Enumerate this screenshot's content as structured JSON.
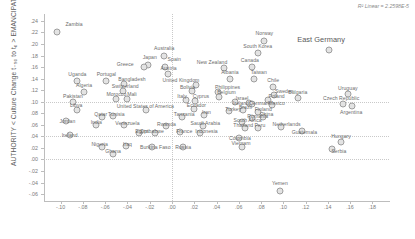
{
  "chart_data": {
    "type": "scatter",
    "title": "",
    "xlabel": "",
    "ylabel": "AUTHORITY < Culture Change t₋₉₀ to t₀ > EMANCIPATION",
    "annotation": "R² Linear = 2.2598E-5",
    "xlim": [
      -0.115,
      0.195
    ],
    "ylim": [
      -0.072,
      0.252
    ],
    "xticks": [
      "-.10",
      "-.08",
      "-.06",
      "-.04",
      "-.02",
      ".00",
      ".02",
      ".04",
      ".06",
      ".08",
      ".10",
      ".12",
      ".14",
      ".16",
      ".18"
    ],
    "xtick_values": [
      -0.1,
      -0.08,
      -0.06,
      -0.04,
      -0.02,
      0.0,
      0.02,
      0.04,
      0.06,
      0.08,
      0.1,
      0.12,
      0.14,
      0.16,
      0.18
    ],
    "yticks": [
      ".24",
      ".22",
      ".20",
      ".18",
      ".16",
      ".14",
      ".12",
      ".10",
      ".08",
      ".06",
      ".04",
      ".02",
      ".00",
      "-.02",
      "-.04",
      "-.06"
    ],
    "ytick_values": [
      0.24,
      0.22,
      0.2,
      0.18,
      0.16,
      0.14,
      0.12,
      0.1,
      0.08,
      0.06,
      0.04,
      0.02,
      0.0,
      -0.02,
      -0.04,
      -0.06
    ],
    "grid": true,
    "gridlines_y": [
      0.1,
      0.04,
      0.0
    ],
    "gridlines_x": [
      0.0
    ],
    "legend": "none",
    "marker_color": "#e3e3e3",
    "marker_edge_color": "#9e9e9e",
    "points": [
      {
        "label": "Zambia",
        "x": -0.103,
        "y": 0.221,
        "lx": -0.088,
        "ly": 0.235
      },
      {
        "label": "East Germany",
        "x": 0.141,
        "y": 0.19,
        "lx": 0.134,
        "ly": 0.208,
        "size": "big"
      },
      {
        "label": "Norway",
        "x": 0.083,
        "y": 0.206,
        "lx": 0.083,
        "ly": 0.219
      },
      {
        "label": "South Korea",
        "x": 0.077,
        "y": 0.184,
        "lx": 0.077,
        "ly": 0.197
      },
      {
        "label": "Australia",
        "x": -0.007,
        "y": 0.18,
        "lx": -0.007,
        "ly": 0.193
      },
      {
        "label": "Japan",
        "x": -0.022,
        "y": 0.163,
        "lx": -0.02,
        "ly": 0.177
      },
      {
        "label": "Spain",
        "x": -0.006,
        "y": 0.161,
        "lx": 0.002,
        "ly": 0.174
      },
      {
        "label": "Greece",
        "x": -0.025,
        "y": 0.16,
        "lx": -0.042,
        "ly": 0.166
      },
      {
        "label": "New Zealand",
        "x": 0.047,
        "y": 0.158,
        "lx": 0.036,
        "ly": 0.168
      },
      {
        "label": "Canada",
        "x": 0.072,
        "y": 0.16,
        "lx": 0.07,
        "ly": 0.172
      },
      {
        "label": "Austria",
        "x": -0.004,
        "y": 0.148,
        "lx": -0.003,
        "ly": 0.159
      },
      {
        "label": "Albania",
        "x": 0.052,
        "y": 0.14,
        "lx": 0.052,
        "ly": 0.152
      },
      {
        "label": "Taiwan",
        "x": 0.074,
        "y": 0.139,
        "lx": 0.078,
        "ly": 0.151
      },
      {
        "label": "Uganda",
        "x": -0.085,
        "y": 0.136,
        "lx": -0.085,
        "ly": 0.148
      },
      {
        "label": "Portugal",
        "x": -0.059,
        "y": 0.136,
        "lx": -0.059,
        "ly": 0.148
      },
      {
        "label": "Bangladesh",
        "x": -0.043,
        "y": 0.131,
        "lx": -0.036,
        "ly": 0.14
      },
      {
        "label": "United Kingdom",
        "x": 0.022,
        "y": 0.129,
        "lx": 0.008,
        "ly": 0.138
      },
      {
        "label": "Algeria",
        "x": -0.079,
        "y": 0.117,
        "lx": -0.079,
        "ly": 0.129
      },
      {
        "label": "Switzerland",
        "x": -0.044,
        "y": 0.119,
        "lx": -0.042,
        "ly": 0.127
      },
      {
        "label": "Bolivia",
        "x": 0.018,
        "y": 0.118,
        "lx": 0.014,
        "ly": 0.126
      },
      {
        "label": "Philippines",
        "x": 0.041,
        "y": 0.117,
        "lx": 0.05,
        "ly": 0.125
      },
      {
        "label": "Chile",
        "x": 0.091,
        "y": 0.125,
        "lx": 0.091,
        "ly": 0.137
      },
      {
        "label": "Sweden",
        "x": 0.092,
        "y": 0.111,
        "lx": 0.101,
        "ly": 0.118
      },
      {
        "label": "Belgium",
        "x": 0.042,
        "y": 0.109,
        "lx": 0.049,
        "ly": 0.116
      },
      {
        "label": "Morocco",
        "x": -0.05,
        "y": 0.105,
        "lx": -0.05,
        "ly": 0.113
      },
      {
        "label": "Mali",
        "x": -0.04,
        "y": 0.105,
        "lx": -0.036,
        "ly": 0.113
      },
      {
        "label": "Italy",
        "x": 0.013,
        "y": 0.103,
        "lx": 0.009,
        "ly": 0.11
      },
      {
        "label": "Cyprus",
        "x": 0.021,
        "y": 0.102,
        "lx": 0.026,
        "ly": 0.11
      },
      {
        "label": "Pakistan",
        "x": -0.089,
        "y": 0.1,
        "lx": -0.089,
        "ly": 0.11
      },
      {
        "label": "Israel",
        "x": 0.057,
        "y": 0.1,
        "lx": 0.063,
        "ly": 0.107
      },
      {
        "label": "Poland",
        "x": 0.086,
        "y": 0.103,
        "lx": 0.094,
        "ly": 0.11
      },
      {
        "label": "Bulgaria",
        "x": 0.113,
        "y": 0.106,
        "lx": 0.113,
        "ly": 0.117
      },
      {
        "label": "Ireland",
        "x": 0.069,
        "y": 0.097,
        "lx": 0.062,
        "ly": 0.097
      },
      {
        "label": "Denmark",
        "x": 0.072,
        "y": 0.096,
        "lx": 0.079,
        "ly": 0.098
      },
      {
        "label": "Mexico",
        "x": 0.09,
        "y": 0.095,
        "lx": 0.094,
        "ly": 0.098
      },
      {
        "label": "Czech Republic",
        "x": 0.154,
        "y": 0.096,
        "lx": 0.152,
        "ly": 0.106
      },
      {
        "label": "Uruguay",
        "x": 0.158,
        "y": 0.113,
        "lx": 0.158,
        "ly": 0.124
      },
      {
        "label": "Argentina",
        "x": 0.162,
        "y": 0.092,
        "lx": 0.161,
        "ly": 0.083
      },
      {
        "label": "Libya",
        "x": -0.085,
        "y": 0.086,
        "lx": -0.086,
        "ly": 0.095
      },
      {
        "label": "United States of America",
        "x": -0.023,
        "y": 0.085,
        "lx": -0.024,
        "ly": 0.093
      },
      {
        "label": "Ecuador",
        "x": 0.02,
        "y": 0.087,
        "lx": 0.022,
        "ly": 0.094
      },
      {
        "label": "Brazil",
        "x": 0.064,
        "y": 0.085,
        "lx": 0.066,
        "ly": 0.091
      },
      {
        "label": "Turkey",
        "x": 0.051,
        "y": 0.084,
        "lx": 0.055,
        "ly": 0.088
      },
      {
        "label": "Finland",
        "x": 0.077,
        "y": 0.082,
        "lx": 0.082,
        "ly": 0.087
      },
      {
        "label": "Qatar",
        "x": -0.063,
        "y": 0.074,
        "lx": -0.064,
        "ly": 0.079
      },
      {
        "label": "Tunisia",
        "x": -0.053,
        "y": 0.075,
        "lx": -0.05,
        "ly": 0.079
      },
      {
        "label": "Iran",
        "x": 0.029,
        "y": 0.077,
        "lx": 0.031,
        "ly": 0.082
      },
      {
        "label": "Tanzania",
        "x": 0.009,
        "y": 0.074,
        "lx": 0.011,
        "ly": 0.078
      },
      {
        "label": "China",
        "x": 0.082,
        "y": 0.073,
        "lx": 0.085,
        "ly": 0.078
      },
      {
        "label": "Romania",
        "x": 0.072,
        "y": 0.071,
        "lx": 0.077,
        "ly": 0.076
      },
      {
        "label": "South Africa",
        "x": 0.063,
        "y": 0.065,
        "lx": 0.068,
        "ly": 0.069
      },
      {
        "label": "Jordan",
        "x": -0.095,
        "y": 0.066,
        "lx": -0.094,
        "ly": 0.067
      },
      {
        "label": "India",
        "x": -0.068,
        "y": 0.06,
        "lx": -0.068,
        "ly": 0.065
      },
      {
        "label": "Venezuela",
        "x": -0.043,
        "y": 0.059,
        "lx": -0.04,
        "ly": 0.064
      },
      {
        "label": "Rwanda",
        "x": -0.005,
        "y": 0.058,
        "lx": -0.005,
        "ly": 0.062
      },
      {
        "label": "Saudi Arabia",
        "x": 0.028,
        "y": 0.058,
        "lx": 0.03,
        "ly": 0.063
      },
      {
        "label": "Thailand",
        "x": 0.066,
        "y": 0.055,
        "lx": 0.064,
        "ly": 0.059
      },
      {
        "label": "Peru",
        "x": 0.077,
        "y": 0.055,
        "lx": 0.079,
        "ly": 0.059
      },
      {
        "label": "Netherlands",
        "x": 0.098,
        "y": 0.057,
        "lx": 0.103,
        "ly": 0.061
      },
      {
        "label": "Ireland",
        "x": -0.092,
        "y": 0.043,
        "lx": -0.092,
        "ly": 0.043
      },
      {
        "label": "Egypt",
        "x": -0.03,
        "y": 0.045,
        "lx": -0.027,
        "ly": 0.049
      },
      {
        "label": "Zimbabwe",
        "x": -0.015,
        "y": 0.046,
        "lx": -0.018,
        "ly": 0.05
      },
      {
        "label": "France",
        "x": 0.007,
        "y": 0.047,
        "lx": 0.011,
        "ly": 0.05
      },
      {
        "label": "Indonesia",
        "x": 0.025,
        "y": 0.046,
        "lx": 0.031,
        "ly": 0.05
      },
      {
        "label": "Guatemala",
        "x": 0.117,
        "y": 0.05,
        "lx": 0.119,
        "ly": 0.048
      },
      {
        "label": "Colombia",
        "x": 0.06,
        "y": 0.038,
        "lx": 0.061,
        "ly": 0.037
      },
      {
        "label": "Hungary",
        "x": 0.152,
        "y": 0.031,
        "lx": 0.152,
        "ly": 0.04
      },
      {
        "label": "Serbia",
        "x": 0.144,
        "y": 0.018,
        "lx": 0.15,
        "ly": 0.015
      },
      {
        "label": "Nigeria",
        "x": -0.063,
        "y": 0.022,
        "lx": -0.065,
        "ly": 0.026
      },
      {
        "label": "Iraq",
        "x": -0.041,
        "y": 0.024,
        "lx": -0.04,
        "ly": 0.026
      },
      {
        "label": "Burkina Faso",
        "x": -0.018,
        "y": 0.022,
        "lx": -0.015,
        "ly": 0.022
      },
      {
        "label": "Ghana",
        "x": -0.053,
        "y": 0.01,
        "lx": -0.053,
        "ly": 0.014
      },
      {
        "label": "Russia",
        "x": 0.01,
        "y": 0.022,
        "lx": 0.01,
        "ly": 0.022
      },
      {
        "label": "Vietnam",
        "x": 0.063,
        "y": 0.022,
        "lx": 0.062,
        "ly": 0.029
      },
      {
        "label": "Yemen",
        "x": 0.097,
        "y": -0.054,
        "lx": 0.097,
        "ly": -0.041
      }
    ]
  }
}
